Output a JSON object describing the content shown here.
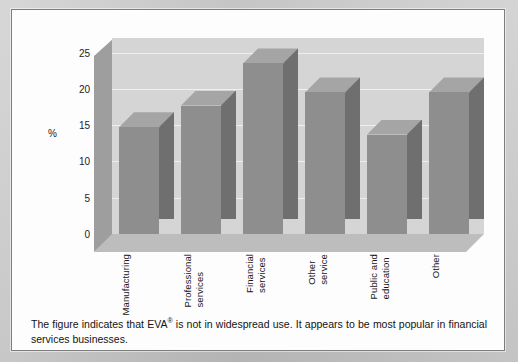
{
  "figure": {
    "caption_prefix": "The figure indicates that ",
    "caption_term": "EVA",
    "caption_mark": "®",
    "caption_suffix": " is not in widespread use. It appears to be most popular in financial services businesses."
  },
  "chart_data": {
    "type": "bar",
    "title": "",
    "subtitle": "",
    "xlabel": "",
    "ylabel": "%",
    "ylim": [
      0,
      27
    ],
    "yticks": [
      0,
      5,
      10,
      15,
      20,
      25
    ],
    "ytick_labels": [
      "0",
      "5",
      "10",
      "15",
      "20",
      "25"
    ],
    "grid": true,
    "legend": "none",
    "three_d": true,
    "categories": [
      "Manufacturing",
      "Professional services",
      "Financial services",
      "Other service",
      "Public and education",
      "Other"
    ],
    "category_lines": [
      [
        "Manufacturing"
      ],
      [
        "Professional",
        "services"
      ],
      [
        "Financial",
        "services"
      ],
      [
        "Other",
        "service"
      ],
      [
        "Public and",
        "education"
      ],
      [
        "Other"
      ]
    ],
    "values": [
      14.7,
      17.7,
      23.5,
      19.5,
      13.7,
      19.5
    ],
    "series": [
      {
        "name": "Percentage of businesses using EVA",
        "values": [
          14.7,
          17.7,
          23.5,
          19.5,
          13.7,
          19.5
        ]
      }
    ],
    "colors": {
      "bar_front": "#8e8e8e",
      "bar_side": "#6f6f6f",
      "bar_top": "#a5a5a5",
      "back_wall": "#d5d5d5",
      "left_wall": "#9e9e9e",
      "floor": "#bdbdbd",
      "gridline": "#efefef",
      "page_background": "#c9c9c9",
      "panel_background": "#fdfdfd",
      "panel_border": "#7d7d7d",
      "text": "#131313"
    }
  }
}
